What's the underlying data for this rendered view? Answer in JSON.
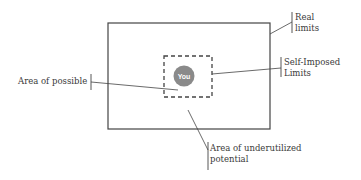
{
  "diagram": {
    "center_label": "You",
    "labels": {
      "real_limits_line1": "Real",
      "real_limits_line2": "limits",
      "self_imposed_line1": "Self-Imposed",
      "self_imposed_line2": "Limits",
      "area_possible": "Area of possible",
      "underutilized_line1": "Area of underutilized",
      "underutilized_line2": "potential"
    },
    "colors": {
      "line": "#444444",
      "circle": "#8a8a8a",
      "text": "#3a3a3a"
    }
  }
}
